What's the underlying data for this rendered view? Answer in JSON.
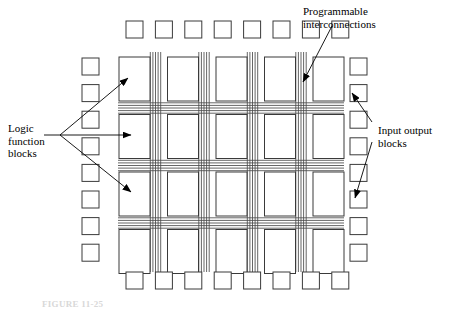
{
  "figure": {
    "type": "fpga-architecture-diagram",
    "caption": "FIGURE 11-25",
    "colors": {
      "outline": "#3a3a3a",
      "interconnect": "#4a4a4a",
      "arrow": "#000000",
      "text": "#000000",
      "background": "#ffffff"
    }
  },
  "labels": [
    {
      "id": "logic-function-blocks",
      "text": "Logic\nfunction\nblocks",
      "lines": [
        "Logic",
        "function",
        "blocks"
      ],
      "x": 8,
      "y": 122,
      "align": "left",
      "pointer_count": 3
    },
    {
      "id": "programmable-interconnections",
      "text": "Programmable\ninterconnections",
      "lines": [
        "Programmable",
        "interconnections"
      ],
      "x": 303,
      "y": 5,
      "align": "left",
      "pointer_count": 1
    },
    {
      "id": "input-output-blocks",
      "text": "Input output\nblocks",
      "lines": [
        "Input output",
        "blocks"
      ],
      "x": 378,
      "y": 124,
      "align": "left",
      "pointer_count": 2
    }
  ],
  "io_blocks": {
    "name": "input-output-blocks",
    "size": 17,
    "rows": {
      "top": {
        "count": 8,
        "y": 21,
        "x_start": 126,
        "x_step": 29.4
      },
      "bottom": {
        "count": 8,
        "y": 272,
        "x_start": 126,
        "x_step": 29.4
      },
      "left": {
        "count": 8,
        "x": 82,
        "y_start": 58,
        "y_step": 26.6
      },
      "right": {
        "count": 8,
        "x": 350,
        "y_start": 58,
        "y_step": 26.6
      }
    }
  },
  "logic_blocks": {
    "name": "logic-function-blocks",
    "columns": 5,
    "rows": 4,
    "width": 31,
    "height": 44,
    "x_start": 119,
    "x_step": 48.5,
    "y_start": 57,
    "y_step": 57.5
  },
  "interconnections": {
    "name": "programmable-interconnections",
    "vertical_bundles": 4,
    "horizontal_bundles": 3,
    "lines_per_bundle": 5,
    "line_spacing": 2.6,
    "vertical_x": [
      155.5,
      204,
      252.5,
      301
    ],
    "horizontal_y": [
      108,
      165.5,
      223
    ],
    "vertical_extent": [
      52,
      272
    ],
    "horizontal_extent": [
      118,
      344
    ]
  },
  "annotations": {
    "logic_pointers": [
      {
        "from": [
          60,
          135
        ],
        "to": [
          128,
          78
        ]
      },
      {
        "from": [
          60,
          135
        ],
        "to": [
          131,
          135
        ]
      },
      {
        "from": [
          60,
          135
        ],
        "to": [
          131,
          192
        ]
      }
    ],
    "interconnect_pointer": {
      "from": [
        332,
        26
      ],
      "to": [
        303,
        82
      ]
    },
    "io_pointers": [
      {
        "from": [
          372,
          122
        ],
        "to": [
          352,
          93
        ]
      },
      {
        "from": [
          372,
          142
        ],
        "to": [
          355,
          198
        ]
      }
    ]
  }
}
